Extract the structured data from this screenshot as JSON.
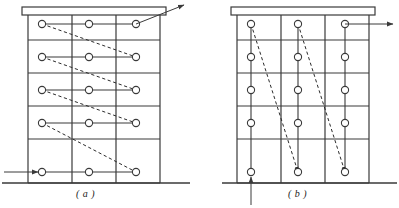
{
  "figure": {
    "caption_a": "( a )",
    "caption_b": "( b )",
    "stroke_color": "#3a3a3a",
    "dash_color": "#2b2b2b",
    "node_fill": "#ffffff",
    "background": "#ffffff"
  },
  "panels": [
    {
      "id": "panel-a",
      "label": "( a )",
      "frame": {
        "left": 28,
        "right": 160,
        "roof_top": 7,
        "roof_bottom": 15,
        "ground_y": 183,
        "columns_x": [
          28,
          72,
          116,
          160
        ],
        "floor_lines_y": [
          15,
          40,
          73,
          106,
          139,
          183
        ]
      },
      "nodes_x": [
        42,
        89,
        136
      ],
      "nodes_y": [
        24,
        57,
        90,
        123,
        172
      ],
      "node_radius": 3.6,
      "connection_style": "horizontal",
      "dashed_links": [
        {
          "from_floor": 0,
          "from_col": 0,
          "to_floor": 1,
          "to_col": 2
        },
        {
          "from_floor": 1,
          "from_col": 0,
          "to_floor": 2,
          "to_col": 2
        },
        {
          "from_floor": 2,
          "from_col": 0,
          "to_floor": 3,
          "to_col": 2
        },
        {
          "from_floor": 3,
          "from_col": 0,
          "to_floor": 4,
          "to_col": 2
        }
      ],
      "input_arrow": {
        "direction": "right",
        "from_x": 4,
        "to_x": 38,
        "y": 172,
        "label": "input-arrow-left"
      },
      "output_arrow": {
        "direction": "up-right",
        "from_x": 136,
        "from_y": 24,
        "to_x": 184,
        "to_y": 5,
        "label": "output-arrow-top-right"
      }
    },
    {
      "id": "panel-b",
      "label": "( b )",
      "frame": {
        "left": 237,
        "right": 369,
        "roof_top": 7,
        "roof_bottom": 15,
        "ground_y": 183,
        "columns_x": [
          237,
          281,
          325,
          369
        ],
        "floor_lines_y": [
          15,
          40,
          73,
          106,
          139,
          183
        ]
      },
      "nodes_x": [
        251,
        298,
        345
      ],
      "nodes_y": [
        24,
        57,
        90,
        123,
        172
      ],
      "node_radius": 3.6,
      "connection_style": "vertical",
      "dashed_links": [
        {
          "from_floor": 0,
          "from_col": 0,
          "to_floor": 4,
          "to_col": 1
        },
        {
          "from_floor": 0,
          "from_col": 1,
          "to_floor": 4,
          "to_col": 2
        }
      ],
      "input_arrow": {
        "direction": "up",
        "from_y": 205,
        "to_y": 177,
        "x": 251,
        "label": "input-arrow-bottom"
      },
      "output_arrow": {
        "direction": "right",
        "from_x": 345,
        "to_x": 393,
        "y": 24,
        "label": "output-arrow-right"
      }
    }
  ]
}
